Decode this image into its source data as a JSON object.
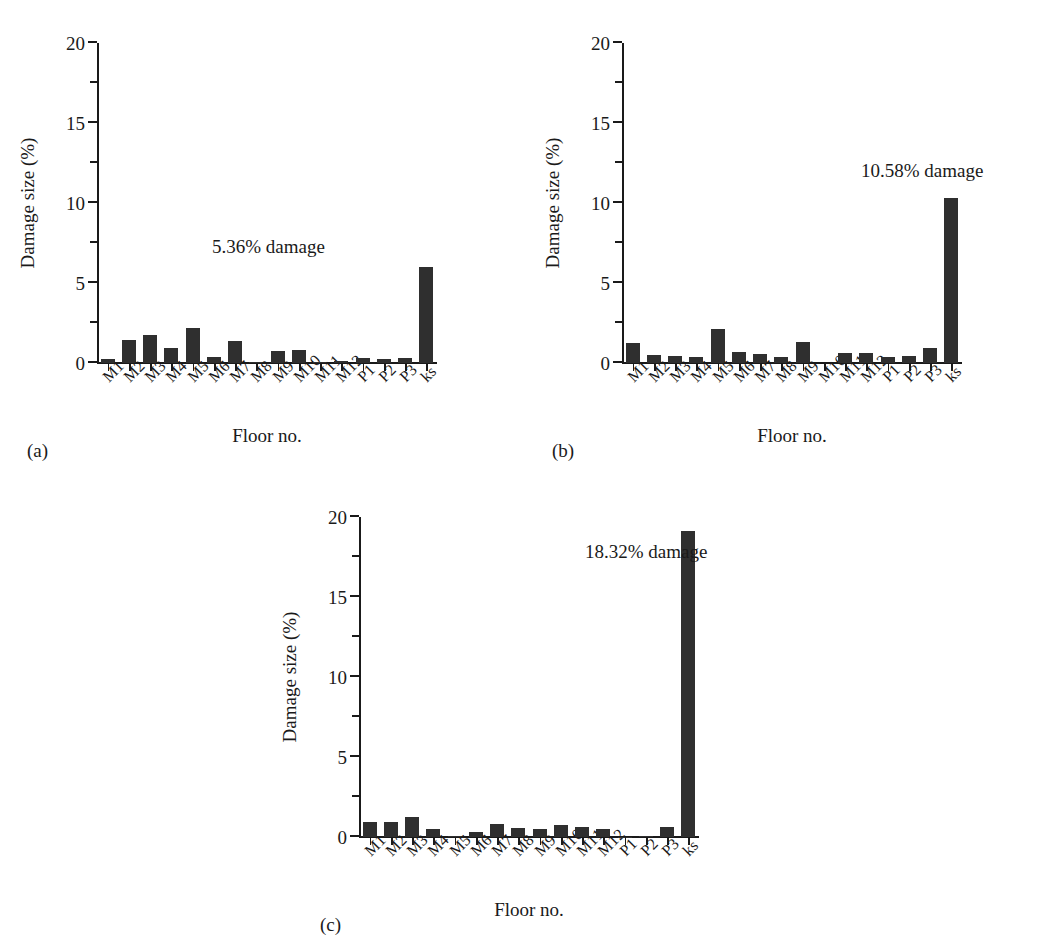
{
  "figure": {
    "panels": [
      {
        "tag": "(a)",
        "annotation": "5.36% damage",
        "ylabel": "Damage size (%)",
        "xlabel": "Floor no."
      },
      {
        "tag": "(b)",
        "annotation": "10.58% damage",
        "ylabel": "Damage size (%)",
        "xlabel": "Floor no."
      },
      {
        "tag": "(c)",
        "annotation": "18.32% damage",
        "ylabel": "Damage size (%)",
        "xlabel": "Floor no."
      }
    ]
  },
  "chart_data": [
    {
      "type": "bar",
      "title": "",
      "panel": "(a)",
      "xlabel": "Floor no.",
      "ylabel": "Damage size (%)",
      "ylim": [
        0,
        20
      ],
      "yticks": [
        0,
        5,
        10,
        15,
        20
      ],
      "ytick_labels": [
        "0",
        "5",
        "10",
        "15",
        "20"
      ],
      "grid": false,
      "legend": "none",
      "bar_color": "#2f2f2f",
      "annotation": "5.36% damage",
      "categories": [
        "M1",
        "M2",
        "M3",
        "M4",
        "M5",
        "M6",
        "M7",
        "M8",
        "M9",
        "M10",
        "M11",
        "M12",
        "P1",
        "P2",
        "P3",
        "ks"
      ],
      "values": [
        0.25,
        1.45,
        1.75,
        0.95,
        2.2,
        0.4,
        1.35,
        0.08,
        0.75,
        0.8,
        0.05,
        0.12,
        0.3,
        0.28,
        0.3,
        6.0
      ]
    },
    {
      "type": "bar",
      "title": "",
      "panel": "(b)",
      "xlabel": "Floor no.",
      "ylabel": "Damage size (%)",
      "ylim": [
        0,
        20
      ],
      "yticks": [
        0,
        5,
        10,
        15,
        20
      ],
      "ytick_labels": [
        "0",
        "5",
        "10",
        "15",
        "20"
      ],
      "grid": false,
      "legend": "none",
      "bar_color": "#2f2f2f",
      "annotation": "10.58% damage",
      "categories": [
        "M1",
        "M2",
        "M3",
        "M4",
        "M5",
        "M6",
        "M7",
        "M8",
        "M9",
        "M10",
        "M11",
        "M12",
        "P1",
        "P2",
        "P3",
        "ks"
      ],
      "values": [
        1.25,
        0.5,
        0.45,
        0.4,
        2.1,
        0.7,
        0.55,
        0.4,
        1.3,
        0.0,
        0.65,
        0.6,
        0.4,
        0.45,
        0.95,
        10.3
      ]
    },
    {
      "type": "bar",
      "title": "",
      "panel": "(c)",
      "xlabel": "Floor no.",
      "ylabel": "Damage size (%)",
      "ylim": [
        0,
        20
      ],
      "yticks": [
        0,
        5,
        10,
        15,
        20
      ],
      "ytick_labels": [
        "0",
        "5",
        "10",
        "15",
        "20"
      ],
      "grid": false,
      "legend": "none",
      "bar_color": "#2f2f2f",
      "annotation": "18.32% damage",
      "categories": [
        "M1",
        "M2",
        "M3",
        "M4",
        "M5",
        "M6",
        "M7",
        "M8",
        "M9",
        "M10",
        "M11",
        "M12",
        "P1",
        "P2",
        "P3",
        "ks"
      ],
      "values": [
        0.95,
        0.95,
        1.25,
        0.5,
        0.05,
        0.3,
        0.8,
        0.55,
        0.5,
        0.75,
        0.6,
        0.5,
        0.03,
        0.08,
        0.65,
        19.1
      ]
    }
  ]
}
